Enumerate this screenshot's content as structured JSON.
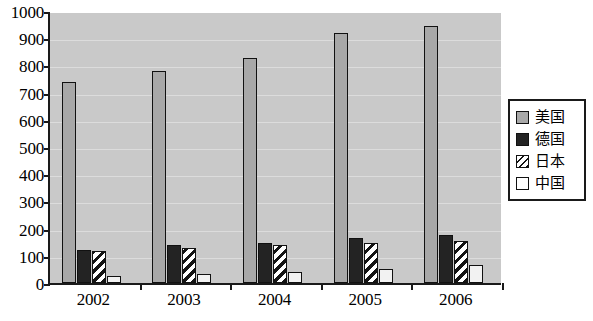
{
  "chart_data": {
    "type": "bar",
    "title": "",
    "xlabel": "",
    "ylabel": "",
    "categories": [
      "2002",
      "2003",
      "2004",
      "2005",
      "2006"
    ],
    "ylim": [
      0,
      1000
    ],
    "y_ticks": [
      0,
      100,
      200,
      300,
      400,
      500,
      600,
      700,
      800,
      900,
      1000
    ],
    "y_tick_labels": [
      "0",
      "100",
      "200",
      "300",
      "400",
      "500",
      "600",
      "700",
      "800",
      "900",
      "1000"
    ],
    "grid": true,
    "legend_position": "right",
    "series": [
      {
        "name": "美国",
        "fill": "solid-gray",
        "color": "#a8a8a8",
        "values": [
          740,
          778,
          828,
          920,
          945
        ]
      },
      {
        "name": "德国",
        "fill": "solid-black",
        "color": "#232323",
        "values": [
          122,
          138,
          148,
          165,
          175
        ]
      },
      {
        "name": "日本",
        "fill": "diagonal-hatch",
        "color": "#ffffff",
        "values": [
          118,
          128,
          140,
          148,
          155
        ]
      },
      {
        "name": "中国",
        "fill": "solid-white",
        "color": "#f2f2f2",
        "values": [
          25,
          32,
          40,
          52,
          65
        ]
      }
    ]
  },
  "legend": {
    "items": [
      {
        "label": "美国",
        "swatch": "solid-gray"
      },
      {
        "label": "德国",
        "swatch": "solid-black"
      },
      {
        "label": "日本",
        "swatch": "diagonal-hatch"
      },
      {
        "label": "中国",
        "swatch": "solid-white"
      }
    ]
  },
  "colors": {
    "plot_background": "#c9c9c9",
    "axis": "#1a1a1a",
    "page_background": "#ffffff"
  }
}
